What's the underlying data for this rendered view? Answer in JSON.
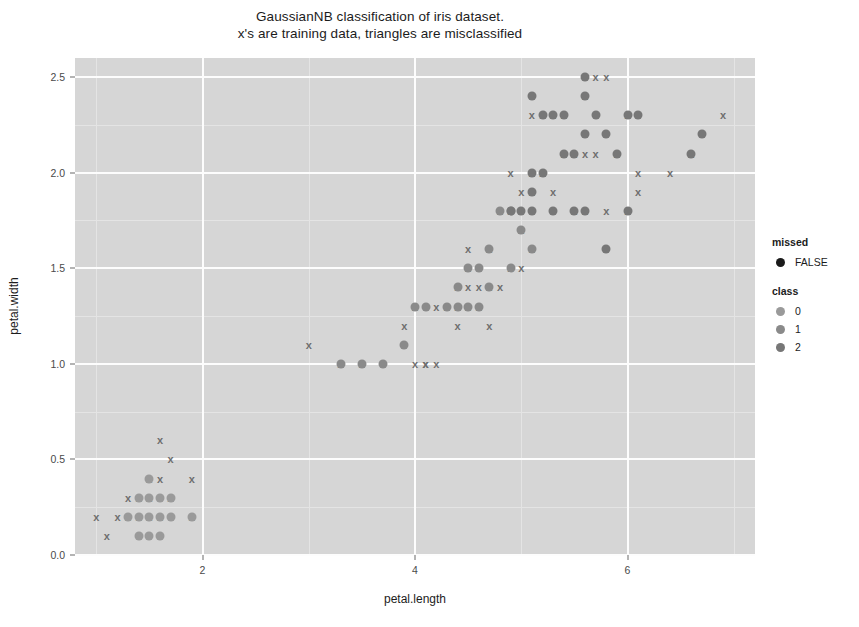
{
  "title": {
    "line1": "GaussianNB classification of iris dataset.",
    "line2": "x's are training data, triangles are misclassified"
  },
  "axes": {
    "xlabel": "petal.length",
    "ylabel": "petal.width",
    "xticks": [
      "2",
      "4",
      "6"
    ],
    "yticks": [
      "0.0",
      "0.5",
      "1.0",
      "1.5",
      "2.0",
      "2.5"
    ],
    "xlim": [
      0.8,
      7.2
    ],
    "ylim": [
      0.0,
      2.6
    ],
    "panel_bg": "#d6d6d6",
    "grid_color": "#fdfdfd"
  },
  "legend": {
    "missed": {
      "title": "missed",
      "items": [
        {
          "label": "FALSE",
          "color": "#1a1a1a"
        }
      ]
    },
    "class": {
      "title": "class",
      "items": [
        {
          "label": "0",
          "color": "#9a9a9a"
        },
        {
          "label": "1",
          "color": "#8a8a8a"
        },
        {
          "label": "2",
          "color": "#777777"
        }
      ]
    }
  },
  "chart_data": {
    "type": "scatter",
    "title": "GaussianNB classification of iris dataset. x's are training data, triangles are misclassified",
    "xlabel": "petal.length",
    "ylabel": "petal.width",
    "xlim": [
      0.8,
      7.2
    ],
    "ylim": [
      0.0,
      2.6
    ],
    "grid": true,
    "legend_position": "right",
    "series": [
      {
        "name": "training data (x)",
        "marker": "x",
        "color": "#6e6e6e",
        "points": [
          [
            1.1,
            0.1
          ],
          [
            1.2,
            0.2
          ],
          [
            1.3,
            0.2
          ],
          [
            1.3,
            0.3
          ],
          [
            1.4,
            0.2
          ],
          [
            1.4,
            0.3
          ],
          [
            1.5,
            0.2
          ],
          [
            1.5,
            0.3
          ],
          [
            1.5,
            0.4
          ],
          [
            1.6,
            0.2
          ],
          [
            1.6,
            0.4
          ],
          [
            1.6,
            0.6
          ],
          [
            1.7,
            0.3
          ],
          [
            1.7,
            0.5
          ],
          [
            1.9,
            0.4
          ],
          [
            1.0,
            0.2
          ],
          [
            1.9,
            0.2
          ],
          [
            3.0,
            1.1
          ],
          [
            3.9,
            1.2
          ],
          [
            3.3,
            1.0
          ],
          [
            4.0,
            1.3
          ],
          [
            4.1,
            1.0
          ],
          [
            4.2,
            1.0
          ],
          [
            4.4,
            1.2
          ],
          [
            4.5,
            1.3
          ],
          [
            4.5,
            1.5
          ],
          [
            4.6,
            1.3
          ],
          [
            4.7,
            1.2
          ],
          [
            4.7,
            1.4
          ],
          [
            4.8,
            1.4
          ],
          [
            4.9,
            1.5
          ],
          [
            5.0,
            1.5
          ],
          [
            4.3,
            1.3
          ],
          [
            4.4,
            1.3
          ],
          [
            4.5,
            1.4
          ],
          [
            4.6,
            1.4
          ],
          [
            4.0,
            1.0
          ],
          [
            4.1,
            1.0
          ],
          [
            3.5,
            1.0
          ],
          [
            4.2,
            1.3
          ],
          [
            4.4,
            1.4
          ],
          [
            4.5,
            1.6
          ],
          [
            4.7,
            1.6
          ],
          [
            5.1,
            1.6
          ],
          [
            4.9,
            1.8
          ],
          [
            5.0,
            1.7
          ],
          [
            5.1,
            1.9
          ],
          [
            5.2,
            2.0
          ],
          [
            5.3,
            1.9
          ],
          [
            5.4,
            2.1
          ],
          [
            5.5,
            2.1
          ],
          [
            5.6,
            2.1
          ],
          [
            5.7,
            2.1
          ],
          [
            5.1,
            2.3
          ],
          [
            5.2,
            2.3
          ],
          [
            5.3,
            2.3
          ],
          [
            5.4,
            2.3
          ],
          [
            5.6,
            2.4
          ],
          [
            5.7,
            2.5
          ],
          [
            5.8,
            2.5
          ],
          [
            6.0,
            2.3
          ],
          [
            6.1,
            2.0
          ],
          [
            6.6,
            2.1
          ],
          [
            6.9,
            2.3
          ],
          [
            5.0,
            1.9
          ],
          [
            5.1,
            2.0
          ],
          [
            5.6,
            1.8
          ],
          [
            5.8,
            1.8
          ],
          [
            6.0,
            1.8
          ],
          [
            6.1,
            1.9
          ],
          [
            6.4,
            2.0
          ],
          [
            4.8,
            1.8
          ],
          [
            4.9,
            2.0
          ],
          [
            5.2,
            2.0
          ],
          [
            5.5,
            1.8
          ],
          [
            5.9,
            2.1
          ]
        ]
      },
      {
        "name": "class 0 (setosa)",
        "marker": "circle",
        "color": "#9a9a9a",
        "points": [
          [
            1.4,
            0.2
          ],
          [
            1.5,
            0.2
          ],
          [
            1.5,
            0.1
          ],
          [
            1.6,
            0.1
          ],
          [
            1.4,
            0.3
          ],
          [
            1.5,
            0.3
          ],
          [
            1.6,
            0.3
          ],
          [
            1.3,
            0.2
          ],
          [
            1.7,
            0.2
          ],
          [
            1.9,
            0.2
          ],
          [
            1.5,
            0.4
          ],
          [
            1.7,
            0.3
          ],
          [
            1.6,
            0.2
          ],
          [
            1.4,
            0.1
          ]
        ]
      },
      {
        "name": "class 1 (versicolor)",
        "marker": "circle",
        "color": "#8a8a8a",
        "points": [
          [
            3.3,
            1.0
          ],
          [
            3.5,
            1.0
          ],
          [
            3.7,
            1.0
          ],
          [
            3.9,
            1.1
          ],
          [
            4.0,
            1.3
          ],
          [
            4.1,
            1.3
          ],
          [
            4.3,
            1.3
          ],
          [
            4.4,
            1.3
          ],
          [
            4.5,
            1.5
          ],
          [
            4.6,
            1.5
          ],
          [
            4.7,
            1.4
          ],
          [
            4.9,
            1.5
          ],
          [
            4.4,
            1.4
          ],
          [
            4.5,
            1.3
          ],
          [
            4.6,
            1.3
          ],
          [
            4.7,
            1.6
          ],
          [
            5.0,
            1.7
          ],
          [
            4.8,
            1.8
          ],
          [
            4.9,
            1.8
          ],
          [
            5.1,
            1.6
          ]
        ]
      },
      {
        "name": "class 2 (virginica)",
        "marker": "circle",
        "color": "#777777",
        "points": [
          [
            5.1,
            1.9
          ],
          [
            5.2,
            2.0
          ],
          [
            5.4,
            2.1
          ],
          [
            5.5,
            2.1
          ],
          [
            5.6,
            2.2
          ],
          [
            5.7,
            2.3
          ],
          [
            5.8,
            2.2
          ],
          [
            5.1,
            2.4
          ],
          [
            5.2,
            2.3
          ],
          [
            5.3,
            2.3
          ],
          [
            5.6,
            2.5
          ],
          [
            6.0,
            2.3
          ],
          [
            6.1,
            2.3
          ],
          [
            6.6,
            2.1
          ],
          [
            6.7,
            2.2
          ],
          [
            5.0,
            1.8
          ],
          [
            5.3,
            1.8
          ],
          [
            5.5,
            1.8
          ],
          [
            5.6,
            1.8
          ],
          [
            5.8,
            1.6
          ],
          [
            6.0,
            1.8
          ],
          [
            5.1,
            2.0
          ],
          [
            5.6,
            2.4
          ],
          [
            5.9,
            2.1
          ],
          [
            5.1,
            1.8
          ],
          [
            5.4,
            2.3
          ],
          [
            4.9,
            1.8
          ]
        ]
      }
    ]
  }
}
